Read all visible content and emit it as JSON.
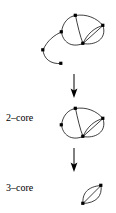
{
  "figure": {
    "type": "diagram",
    "background_color": "#ffffff",
    "ink_color": "#000000",
    "width": 116,
    "height": 213
  },
  "labels": {
    "two_core": "2–core",
    "three_core": "3–core"
  },
  "stages": [
    {
      "id": "original-graph",
      "name": "original-graph",
      "label": "",
      "vertex_count": 6,
      "edge_count": 8,
      "vertices": [
        {
          "id": "t",
          "cx": 75.5,
          "cy": 15.5,
          "degree": 3
        },
        {
          "id": "r",
          "cx": 103.0,
          "cy": 25.5,
          "degree": 4
        },
        {
          "id": "b",
          "cx": 83.0,
          "cy": 43.5,
          "degree": 5
        },
        {
          "id": "l",
          "cx": 61.5,
          "cy": 32.0,
          "degree": 3
        },
        {
          "id": "p1",
          "cx": 43.0,
          "cy": 50.0,
          "degree": 2
        },
        {
          "id": "p2",
          "cx": 61.0,
          "cy": 63.5,
          "degree": 1
        }
      ],
      "edges": [
        {
          "from": "t",
          "to": "r",
          "kind": "arc-upper"
        },
        {
          "from": "t",
          "to": "b",
          "kind": "straight"
        },
        {
          "from": "t",
          "to": "l",
          "kind": "arc-left-upper"
        },
        {
          "from": "l",
          "to": "b",
          "kind": "arc-lower"
        },
        {
          "from": "b",
          "to": "r",
          "kind": "straight"
        },
        {
          "from": "b",
          "to": "r",
          "kind": "arc-bulge"
        },
        {
          "from": "b",
          "to": "r",
          "kind": "arc-outer"
        },
        {
          "from": "l",
          "to": "p1",
          "kind": "pendant-curve"
        },
        {
          "from": "p1",
          "to": "p2",
          "kind": "pendant-curve"
        }
      ]
    },
    {
      "id": "two-core-graph",
      "name": "two-core-graph",
      "label": "2–core",
      "vertex_count": 4,
      "edge_count": 7,
      "vertices": [
        {
          "id": "t",
          "cx": 75.5,
          "cy": 108.5,
          "degree": 3
        },
        {
          "id": "r",
          "cx": 103.0,
          "cy": 118.5,
          "degree": 4
        },
        {
          "id": "b",
          "cx": 83.0,
          "cy": 136.5,
          "degree": 5
        },
        {
          "id": "l",
          "cx": 61.5,
          "cy": 125.0,
          "degree": 3
        }
      ],
      "edges": [
        {
          "from": "t",
          "to": "r",
          "kind": "arc-upper"
        },
        {
          "from": "t",
          "to": "b",
          "kind": "straight"
        },
        {
          "from": "t",
          "to": "l",
          "kind": "arc-left-upper"
        },
        {
          "from": "l",
          "to": "b",
          "kind": "arc-lower"
        },
        {
          "from": "b",
          "to": "r",
          "kind": "straight"
        },
        {
          "from": "b",
          "to": "r",
          "kind": "arc-bulge"
        },
        {
          "from": "b",
          "to": "r",
          "kind": "arc-outer"
        }
      ]
    },
    {
      "id": "three-core-graph",
      "name": "three-core-graph",
      "label": "3–core",
      "vertex_count": 2,
      "edge_count": 3,
      "vertices": [
        {
          "id": "b",
          "cx": 83.0,
          "cy": 203.5,
          "degree": 3
        },
        {
          "id": "r",
          "cx": 101.0,
          "cy": 185.5,
          "degree": 3
        }
      ],
      "edges": [
        {
          "from": "b",
          "to": "r",
          "kind": "straight"
        },
        {
          "from": "b",
          "to": "r",
          "kind": "arc-left"
        },
        {
          "from": "b",
          "to": "r",
          "kind": "arc-right"
        }
      ]
    }
  ],
  "arrows": [
    {
      "id": "arrow-1",
      "name": "arrow-original-to-2core",
      "direction": "down",
      "x": 74,
      "y1": 74,
      "y2": 97
    },
    {
      "id": "arrow-2",
      "name": "arrow-2core-to-3core",
      "direction": "down",
      "x": 74,
      "y1": 148,
      "y2": 171
    }
  ]
}
